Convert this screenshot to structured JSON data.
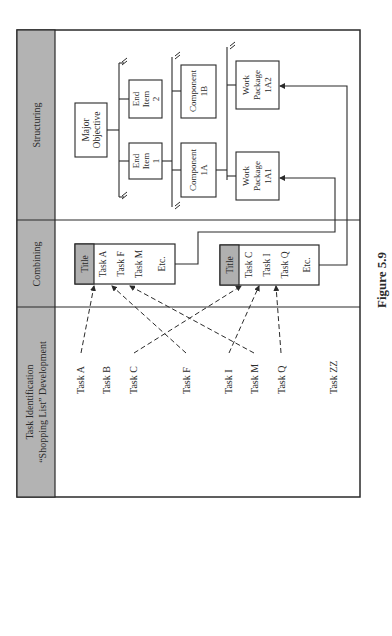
{
  "figure": {
    "caption": "Figure 5.9",
    "orientation": "rotated 90° counter-clockwise"
  },
  "columns": [
    {
      "id": "task-identification",
      "header_line1": "Task Identification",
      "header_line2": "“Shopping List” Development"
    },
    {
      "id": "combining",
      "header": "Combining"
    },
    {
      "id": "structuring",
      "header": "Structuring"
    }
  ],
  "task_list": [
    "Task A",
    "Task B",
    "Task C",
    "Task F",
    "Task I",
    "Task M",
    "Task Q",
    "Task ZZ"
  ],
  "combining_groups": [
    {
      "title": "Title",
      "items": [
        "Task A",
        "Task F",
        "Task M",
        "Etc."
      ],
      "links_to": "Work Package 1A1"
    },
    {
      "title": "Title",
      "items": [
        "Task C",
        "Task I",
        "Task Q",
        "Etc."
      ],
      "links_to": "Work Package 1A2"
    }
  ],
  "task_mappings": [
    {
      "task": "Task A",
      "group": 0,
      "item": "Task A"
    },
    {
      "task": "Task F",
      "group": 0,
      "item": "Task F"
    },
    {
      "task": "Task M",
      "group": 0,
      "item": "Task M"
    },
    {
      "task": "Task C",
      "group": 1,
      "item": "Task C"
    },
    {
      "task": "Task I",
      "group": 1,
      "item": "Task I"
    },
    {
      "task": "Task Q",
      "group": 1,
      "item": "Task Q"
    }
  ],
  "structure": {
    "major_objective": {
      "line1": "Major",
      "line2": "Objective"
    },
    "end_items": [
      {
        "line1": "End",
        "line2": "Item",
        "line3": "1"
      },
      {
        "line1": "End",
        "line2": "Item",
        "line3": "2"
      }
    ],
    "components": [
      {
        "line1": "Component",
        "line2": "1A"
      },
      {
        "line1": "Component",
        "line2": "1B"
      }
    ],
    "work_packages": [
      {
        "line1": "Work",
        "line2": "Package",
        "line3": "1A1"
      },
      {
        "line1": "Work",
        "line2": "Package",
        "line3": "1A2"
      }
    ]
  },
  "colors": {
    "header_fill": "#b3b3b3",
    "title_fill": "#b0b0b0",
    "line": "#2a2a2a",
    "background": "#ffffff"
  }
}
